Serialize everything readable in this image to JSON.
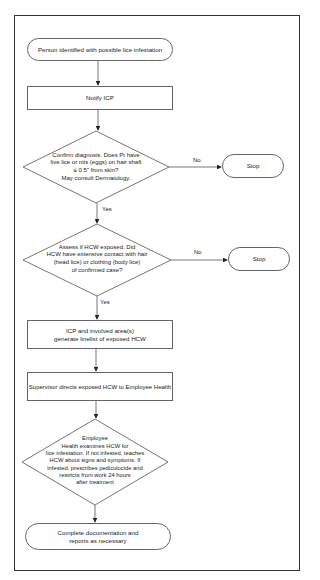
{
  "flowchart": {
    "start": "Person identified with possible lice infestation",
    "notify": "Notify ICP",
    "decision1": "Confirm diagnosis. Does Pt have\nlive lice or nits (eggs) on hair shaft\n≤ 0.5\" from skin?\nMay consult Dermatology.",
    "decision1_no": "No",
    "decision1_yes": "Yes",
    "stop1": "Stop",
    "decision2": "Assess if HCW exposed. Did\nHCW have extensive contact with hair\n(head lice) or clothing (body lice)\nof confirmed case?",
    "decision2_no": "No",
    "decision2_yes": "Yes",
    "stop2": "Stop",
    "linelist": "ICP and involved area(s)\ngenerate linelist of exposed HCW",
    "supervisor": "Supervisor directs exposed HCW to Employee Health",
    "decision3": "Employee\nHealth examines HCW for\nlice infestation. If not infested, teaches\nHCW about signs and symptoms. If\ninfested, prescribes pediculocide and\nrestricts from work 24 hours\nafter treatment",
    "end": "Complete documentation and\nreports as necessary"
  }
}
